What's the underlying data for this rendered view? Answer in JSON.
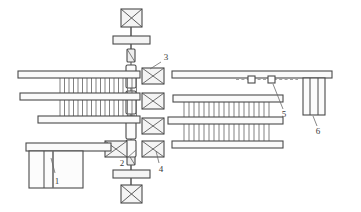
{
  "figure": {
    "background_color": "#ffffff",
    "line_color": "#4a4a4a",
    "fill_color": "#f2f2f2",
    "callout_color": "#3a3a3a"
  },
  "callouts": [
    {
      "id": "1",
      "label": "1",
      "x": 57,
      "y": 178,
      "leader": {
        "x1": 55,
        "y1": 172,
        "x2": 51,
        "y2": 158
      }
    },
    {
      "id": "2",
      "label": "2",
      "x": 123,
      "y": 163,
      "leader": {
        "x1": 127,
        "y1": 158,
        "x2": 136,
        "y2": 150
      }
    },
    {
      "id": "3",
      "label": "3",
      "x": 164,
      "y": 59,
      "leader": {
        "x1": 162,
        "y1": 61,
        "x2": 151,
        "y2": 68
      }
    },
    {
      "id": "4",
      "label": "4",
      "x": 162,
      "y": 167,
      "leader": {
        "x1": 160,
        "y1": 162,
        "x2": 156,
        "y2": 150
      }
    },
    {
      "id": "5",
      "label": "5",
      "x": 284,
      "y": 114,
      "leader": {
        "x1": 283,
        "y1": 108,
        "x2": 274,
        "y2": 83
      }
    },
    {
      "id": "6",
      "label": "6",
      "x": 318,
      "y": 131,
      "leader": {
        "x1": 317,
        "y1": 125,
        "x2": 313,
        "y2": 115
      }
    }
  ],
  "components": {
    "top_drive_unit": {
      "name": "top motor",
      "shape": "crossed-box",
      "x": 121,
      "y": 9,
      "w": 20,
      "h": 18
    },
    "top_crossbar": {
      "name": "top coupling bar",
      "x": 113,
      "y": 36,
      "w": 37,
      "h": 8
    },
    "top_bearing": {
      "name": "upper bearing",
      "x": 127,
      "y": 48,
      "w": 8,
      "h": 13
    },
    "bottom_drive_unit": {
      "name": "bottom motor",
      "shape": "crossed-box",
      "x": 121,
      "y": 185,
      "w": 20,
      "h": 18
    },
    "bottom_crossbar": {
      "name": "bottom coupling bar",
      "x": 113,
      "y": 168,
      "w": 37,
      "h": 8
    },
    "bottom_bearing": {
      "name": "lower bearing",
      "x": 127,
      "y": 152,
      "w": 8,
      "h": 13
    },
    "shaft": {
      "name": "central vertical shaft",
      "x": 130,
      "y": 27,
      "w": 2,
      "h": 166
    },
    "shaft_bearings": [
      {
        "x": 126,
        "y": 66,
        "w": 9,
        "h": 22
      },
      {
        "x": 126,
        "y": 92,
        "w": 9,
        "h": 22
      },
      {
        "x": 126,
        "y": 116,
        "w": 9,
        "h": 22
      },
      {
        "x": 126,
        "y": 139,
        "w": 9,
        "h": 16
      }
    ],
    "right_hub_boxes": [
      {
        "x": 142,
        "y": 69,
        "w": 22,
        "h": 16
      },
      {
        "x": 142,
        "y": 93,
        "w": 22,
        "h": 16
      },
      {
        "x": 142,
        "y": 117,
        "w": 22,
        "h": 16
      },
      {
        "x": 142,
        "y": 140,
        "w": 22,
        "h": 16
      }
    ],
    "left_hub_boxes": [
      {
        "x": 108,
        "y": 140,
        "w": 22,
        "h": 16
      }
    ],
    "left_bank_bars": [
      {
        "x": 18,
        "y": 71,
        "w": 122,
        "h": 7
      },
      {
        "x": 20,
        "y": 93,
        "w": 120,
        "h": 7
      },
      {
        "x": 38,
        "y": 116,
        "w": 102,
        "h": 7
      }
    ],
    "left_bank_fin_groups": [
      {
        "x": 58,
        "y": 78,
        "w": 78,
        "h": 15,
        "count": 17
      },
      {
        "x": 58,
        "y": 100,
        "w": 78,
        "h": 16,
        "count": 17
      }
    ],
    "right_bank_bars": [
      {
        "x": 172,
        "y": 71,
        "w": 160,
        "h": 7
      },
      {
        "x": 173,
        "y": 95,
        "w": 110,
        "h": 7
      },
      {
        "x": 168,
        "y": 117,
        "w": 115,
        "h": 7
      },
      {
        "x": 172,
        "y": 141,
        "w": 111,
        "h": 7
      }
    ],
    "right_bank_fin_groups": [
      {
        "x": 182,
        "y": 102,
        "w": 92,
        "h": 15,
        "count": 18
      },
      {
        "x": 182,
        "y": 124,
        "w": 92,
        "h": 17,
        "count": 18
      }
    ],
    "item5_markers": [
      {
        "x": 248,
        "y": 76,
        "w": 7,
        "h": 7
      },
      {
        "x": 268,
        "y": 76,
        "w": 7,
        "h": 7
      }
    ],
    "item5_dashline": {
      "x1": 238,
      "y1": 79,
      "x2": 296,
      "y2": 79
    },
    "item6_column": {
      "x": 303,
      "y": 78,
      "w": 22,
      "h": 37,
      "dividers": 2
    },
    "item1_block": {
      "x": 28,
      "y": 152,
      "w": 54,
      "h": 36,
      "dividers": 2
    },
    "item1_top_bar": {
      "x": 25,
      "y": 143,
      "w": 85,
      "h": 8
    }
  }
}
